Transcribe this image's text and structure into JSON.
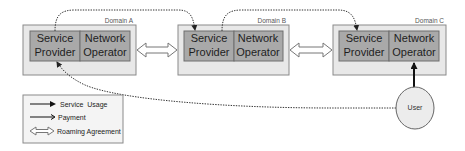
{
  "diagram": {
    "domains": [
      {
        "label": "Domain A",
        "left_cell": [
          "Service",
          "Provider"
        ],
        "right_cell": [
          "Network",
          "Operator"
        ]
      },
      {
        "label": "Domain B",
        "left_cell": [
          "Service",
          "Provider"
        ],
        "right_cell": [
          "Network",
          "Operator"
        ]
      },
      {
        "label": "Domain C",
        "left_cell": [
          "Service",
          "Provider"
        ],
        "right_cell": [
          "Network",
          "Operator"
        ]
      }
    ],
    "user": {
      "label": "User"
    },
    "legend": {
      "items": [
        {
          "icon": "solid-arrow-icon",
          "label": "Service  Usage"
        },
        {
          "icon": "open-arrow-icon",
          "label": "Payment"
        },
        {
          "icon": "double-arrow-icon",
          "label": "Roaming Agreement"
        }
      ]
    },
    "connections": [
      {
        "from": "Domain A Service Provider",
        "to": "Domain B Service Provider",
        "type": "dotted"
      },
      {
        "from": "Domain B Network Operator",
        "to": "Domain C Service Provider",
        "type": "dotted"
      },
      {
        "from": "User",
        "to": "Domain A Service Provider",
        "type": "dotted"
      },
      {
        "from": "User",
        "to": "Domain C Network Operator",
        "type": "service-usage"
      },
      {
        "from": "Domain A",
        "to": "Domain B",
        "type": "roaming-agreement"
      },
      {
        "from": "Domain B",
        "to": "Domain C",
        "type": "roaming-agreement"
      }
    ]
  }
}
